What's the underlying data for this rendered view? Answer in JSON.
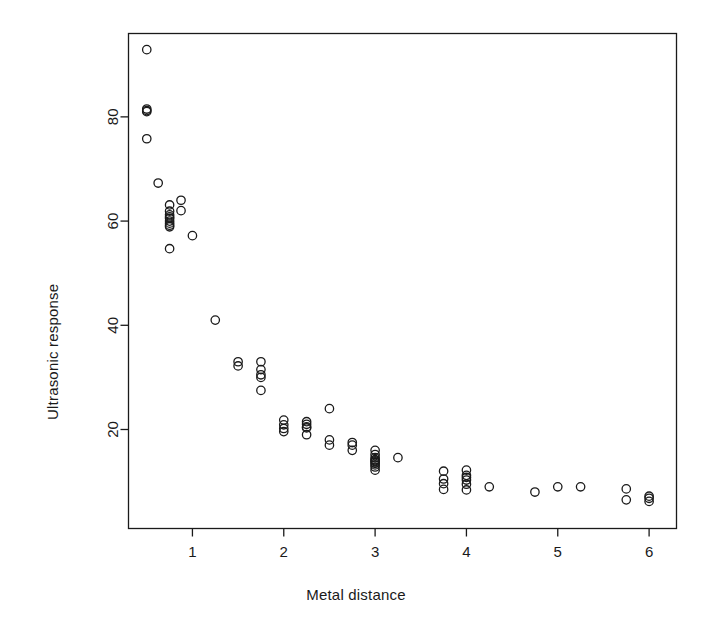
{
  "chart_data": {
    "type": "scatter",
    "title": "",
    "xlabel": "Metal distance",
    "ylabel": "Ultrasonic response",
    "xlim": [
      0.3,
      6.3
    ],
    "ylim": [
      1.0,
      96.0
    ],
    "xticks": [
      1,
      2,
      3,
      4,
      5,
      6
    ],
    "yticks": [
      20,
      40,
      60,
      80
    ],
    "grid": false,
    "legend": null,
    "marker": {
      "shape": "open-circle",
      "radius": 4.2,
      "stroke": "#1a1a1a",
      "fill": "none",
      "stroke_width": 1.3
    },
    "box": true,
    "n_points": 79,
    "x": [
      0.5,
      0.5,
      0.5,
      0.5,
      0.5,
      0.625,
      0.75,
      0.75,
      0.75,
      0.75,
      0.75,
      0.75,
      0.75,
      0.75,
      0.75,
      0.75,
      0.875,
      0.875,
      1.0,
      1.25,
      1.5,
      1.5,
      1.75,
      1.75,
      1.75,
      1.75,
      1.75,
      2.0,
      2.0,
      2.0,
      2.0,
      2.25,
      2.25,
      2.25,
      2.25,
      2.25,
      2.5,
      2.5,
      2.5,
      2.75,
      2.75,
      2.75,
      3.0,
      3.0,
      3.0,
      3.0,
      3.0,
      3.0,
      3.0,
      3.0,
      3.0,
      3.0,
      3.25,
      3.75,
      3.75,
      3.75,
      3.75,
      4.0,
      4.0,
      4.0,
      4.0,
      4.0,
      4.0,
      4.25,
      4.75,
      5.0,
      5.25,
      5.75,
      5.75,
      6.0,
      6.0,
      6.0
    ],
    "y": [
      92.9,
      81.5,
      81.2,
      81.0,
      75.8,
      67.3,
      63.1,
      61.9,
      61.2,
      60.8,
      60.5,
      60.0,
      59.6,
      59.2,
      58.9,
      54.7,
      64.0,
      62.0,
      57.2,
      41.0,
      33.0,
      32.2,
      33.0,
      30.5,
      30.0,
      27.5,
      31.5,
      21.8,
      20.9,
      20.2,
      19.6,
      21.5,
      21.0,
      20.5,
      20.3,
      19.0,
      24.0,
      18.0,
      17.0,
      17.5,
      17.0,
      16.0,
      16.0,
      15.2,
      14.6,
      14.2,
      14.0,
      13.8,
      13.5,
      13.2,
      12.8,
      12.2,
      14.6,
      12.0,
      10.5,
      9.6,
      8.5,
      12.2,
      11.2,
      10.8,
      10.3,
      9.5,
      8.4,
      9.0,
      8.0,
      9.0,
      9.0,
      8.6,
      6.5,
      7.2,
      6.8,
      6.2
    ]
  },
  "axis": {
    "x_tick_labels": [
      "1",
      "2",
      "3",
      "4",
      "5",
      "6"
    ],
    "y_tick_labels": [
      "20",
      "40",
      "60",
      "80"
    ],
    "x_axis_title": "Metal distance",
    "y_axis_title": "Ultrasonic response"
  },
  "colors": {
    "background": "#ffffff",
    "ink": "#1a1a1a",
    "marker_stroke": "#1a1a1a"
  }
}
